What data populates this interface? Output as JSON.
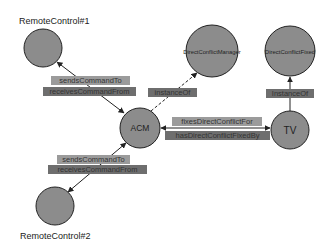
{
  "diagram": {
    "colors": {
      "node_fill": "#8c8c8c",
      "node_stroke": "#222222",
      "label_light": "#9b9b9b",
      "label_dark": "#6e6e6e",
      "edge": "#222222"
    },
    "nodes": {
      "remote1": {
        "label": "RemoteControl#1"
      },
      "dcm": {
        "label": "DirectConflictManager"
      },
      "dcf": {
        "label": "DirectConflictFixed"
      },
      "acm": {
        "label": "ACM"
      },
      "tv": {
        "label": "TV"
      },
      "remote2": {
        "label": "RemoteControl#2"
      }
    },
    "edges": {
      "r1_sends": {
        "label": "sendsCommandTo"
      },
      "r1_receives": {
        "label": "receivesCommandFrom"
      },
      "acm_instance": {
        "label": "instanceOf"
      },
      "tv_instance": {
        "label": "InstanceOf"
      },
      "fixes": {
        "label": "fixesDirectConflictFor"
      },
      "fixedby": {
        "label": "hasDirectConflictFixedBy"
      },
      "r2_sends": {
        "label": "sendsCommandTo"
      },
      "r2_receives": {
        "label": "receivesCommandFrom"
      }
    }
  }
}
